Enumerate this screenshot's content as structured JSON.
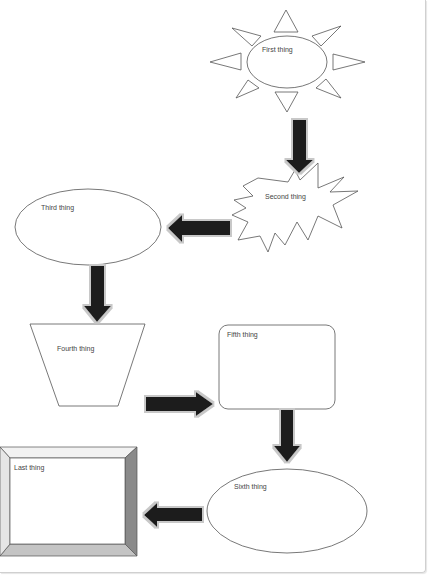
{
  "diagram": {
    "type": "flowchart",
    "shapes": [
      {
        "id": "first",
        "shape": "sun",
        "label": "First thing"
      },
      {
        "id": "second",
        "shape": "explosion",
        "label": "Second thing"
      },
      {
        "id": "third",
        "shape": "ellipse",
        "label": "Third thing"
      },
      {
        "id": "fourth",
        "shape": "trapezoid",
        "label": "Fourth thing"
      },
      {
        "id": "fifth",
        "shape": "rounded-rectangle",
        "label": "Fifth thing"
      },
      {
        "id": "sixth",
        "shape": "ellipse",
        "label": "Sixth thing"
      },
      {
        "id": "last",
        "shape": "bevel",
        "label": "Last thing"
      }
    ],
    "arrows": [
      {
        "from": "first",
        "to": "second",
        "direction": "down"
      },
      {
        "from": "second",
        "to": "third",
        "direction": "left"
      },
      {
        "from": "third",
        "to": "fourth",
        "direction": "down"
      },
      {
        "from": "fourth",
        "to": "fifth",
        "direction": "right"
      },
      {
        "from": "fifth",
        "to": "sixth",
        "direction": "down"
      },
      {
        "from": "sixth",
        "to": "last",
        "direction": "left"
      }
    ],
    "colors": {
      "outline": "#555555",
      "arrow_fill": "#1f1f1f",
      "arrow_glow": "#c8c8c8",
      "bevel_dark": "#8a8a8a",
      "bevel_light": "#c4c4c4",
      "bevel_top": "#f2f2f2"
    }
  }
}
